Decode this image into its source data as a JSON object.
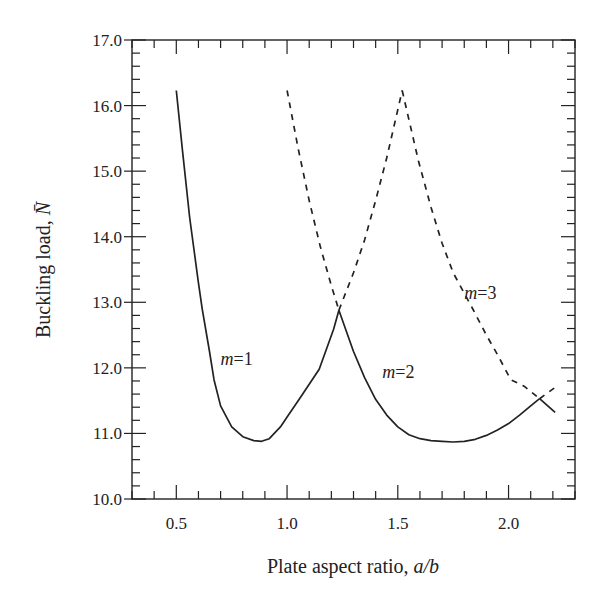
{
  "chart_data": {
    "type": "line",
    "title": "",
    "xlabel": "Plate aspect ratio, ",
    "xlabel_italic": "a/b",
    "ylabel": "Buckling load, ",
    "ylabel_italic": "N̄",
    "xlim": [
      0.3,
      2.3
    ],
    "ylim": [
      10.0,
      17.0
    ],
    "xticks_major": [
      0.5,
      1.0,
      1.5,
      2.0
    ],
    "xtick_labels": [
      "0.5",
      "1.0",
      "1.5",
      "2.0"
    ],
    "xtick_minor_step": 0.1,
    "yticks_major": [
      10.0,
      11.0,
      12.0,
      13.0,
      14.0,
      15.0,
      16.0,
      17.0
    ],
    "ytick_labels": [
      "10.0",
      "11.0",
      "12.0",
      "13.0",
      "14.0",
      "15.0",
      "16.0",
      "17.0"
    ],
    "ytick_minor_step": 0.2,
    "grid": false,
    "legend": "none",
    "series": [
      {
        "name": "m=1",
        "style": "solid",
        "x": [
          0.5,
          0.527,
          0.56,
          0.6,
          0.617,
          0.65,
          0.67,
          0.7,
          0.75,
          0.8,
          0.85,
          0.885,
          0.92,
          0.97,
          1.0,
          1.055,
          1.1,
          1.145,
          1.21,
          1.234
        ],
        "y": [
          16.23,
          15.34,
          14.3,
          13.3,
          12.9,
          12.25,
          11.82,
          11.42,
          11.1,
          10.95,
          10.89,
          10.88,
          10.92,
          11.1,
          11.25,
          11.52,
          11.75,
          11.98,
          12.59,
          12.88
        ]
      },
      {
        "name": "m=2",
        "style": "dashed",
        "x": [
          1.0,
          1.05,
          1.1,
          1.15,
          1.2,
          1.234
        ],
        "y": [
          16.23,
          15.35,
          14.55,
          13.85,
          13.25,
          12.88
        ]
      },
      {
        "name": "m=2",
        "style": "solid",
        "x": [
          1.234,
          1.3,
          1.35,
          1.4,
          1.45,
          1.5,
          1.55,
          1.6,
          1.65,
          1.7,
          1.75,
          1.8,
          1.85,
          1.9,
          1.95,
          2.0,
          2.05,
          2.1,
          2.14
        ],
        "y": [
          12.88,
          12.25,
          11.85,
          11.52,
          11.28,
          11.1,
          10.98,
          10.92,
          10.89,
          10.88,
          10.87,
          10.88,
          10.91,
          10.97,
          11.05,
          11.15,
          11.28,
          11.42,
          11.53
        ]
      },
      {
        "name": "m=2",
        "style": "dashed",
        "x": [
          1.234,
          1.3,
          1.35,
          1.4,
          1.45,
          1.52
        ],
        "y": [
          12.88,
          13.45,
          13.95,
          14.55,
          15.2,
          16.23
        ]
      },
      {
        "name": "m=3",
        "style": "dashed",
        "x": [
          1.52,
          1.593,
          1.65,
          1.7,
          1.75,
          1.835,
          1.9,
          1.95,
          2.01,
          2.07,
          2.14
        ],
        "y": [
          16.23,
          15.16,
          14.45,
          13.9,
          13.45,
          12.92,
          12.5,
          12.2,
          11.82,
          11.72,
          11.53
        ]
      },
      {
        "name": "m=3",
        "style": "dashed",
        "x": [
          2.14,
          2.21
        ],
        "y": [
          11.53,
          11.7
        ]
      },
      {
        "name": "m=2",
        "style": "solid",
        "x": [
          2.14,
          2.21
        ],
        "y": [
          11.53,
          11.32
        ]
      }
    ],
    "annotations": [
      {
        "text_italic": "m",
        "text": "=1",
        "x": 0.7,
        "y": 12.05
      },
      {
        "text_italic": "m",
        "text": "=2",
        "x": 1.43,
        "y": 11.85
      },
      {
        "text_italic": "m",
        "text": "=3",
        "x": 1.8,
        "y": 13.05
      }
    ],
    "line_color": "#222222"
  }
}
